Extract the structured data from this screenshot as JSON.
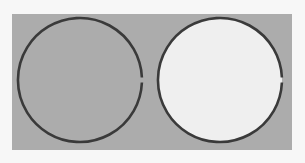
{
  "figure": {
    "background_color": "#acacac",
    "page_color": "#f7f7f7",
    "stroke_color": "#3a3a3a",
    "circles": [
      {
        "id": "left",
        "cx": 80,
        "cy": 80,
        "r": 62,
        "fill": "#acacac",
        "gap_at": "right"
      },
      {
        "id": "right",
        "cx": 220,
        "cy": 80,
        "r": 62,
        "fill": "#efefef",
        "gap_at": "right"
      }
    ]
  }
}
